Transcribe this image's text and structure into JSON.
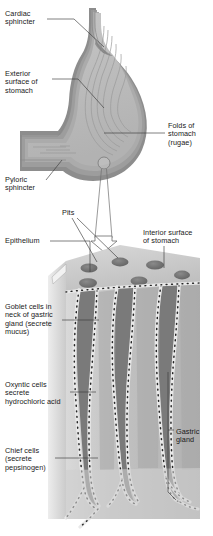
{
  "figure": {
    "background_color": "#ffffff",
    "text_color": "#1a1a1a",
    "leader_line_color": "#3a3a3a"
  },
  "palette": {
    "outer_muscle": "#8e8e8e",
    "muscle_mid": "#a6a6a6",
    "submucosa": "#b9b9b9",
    "mucosa_light": "#cfcfcf",
    "lumen": "#bdbdbd",
    "rugae_line": "#9a9a9a",
    "block_top": "#c8c8c8",
    "block_front": "#bcbcbc",
    "block_side": "#d6d6d6",
    "pit_dark": "#6f6f6f",
    "gland_lumen": "#7b7b7b",
    "cell_light": "#e8e8e8",
    "cell_dot": "#2b2b2b"
  },
  "upper_diagram": {
    "name": "stomach-sagittal-section",
    "labels": [
      {
        "id": "cardiac-sphincter",
        "text": "Cardiac\nsphincter",
        "x": 5,
        "y": 10,
        "leader": "from label right edge up-right to the esophageal junction"
      },
      {
        "id": "exterior-surface-of-stomach",
        "text": "Exterior\nsurface of\nstomach",
        "x": 5,
        "y": 70,
        "leader": "horizontal then diagonal down-right to the greater curvature wall"
      },
      {
        "id": "folds-of-stomach-rugae",
        "text": "Folds of\nstomach\n(rugae)",
        "x": 168,
        "y": 122,
        "leader": "horizontal left into the rugae of the stomach lumen"
      },
      {
        "id": "pyloric-sphincter",
        "text": "Pyloric\nsphincter",
        "x": 5,
        "y": 176,
        "leader": "diagonal up-right to the pyloric canal"
      }
    ],
    "callout": {
      "id": "magnification-callout",
      "circle_center_x": 104,
      "circle_center_y": 163,
      "circle_radius": 6,
      "arrow_tip_y": 246,
      "description": "small circle on the stomach wall expands downward into a hollow arrow pointing at the magnified block"
    }
  },
  "lower_diagram": {
    "name": "gastric-mucosa-block",
    "labels": [
      {
        "id": "pits",
        "text": "Pits",
        "x": 62,
        "y": 209,
        "leader": "two lines fanning down-right to two gastric pits on the block top"
      },
      {
        "id": "epithelium",
        "text": "Epithelium",
        "x": 5,
        "y": 238,
        "leader": "horizontal right to the cut epithelial edge of the block"
      },
      {
        "id": "interior-surface-of-stomach",
        "text": "Interior surface\nof stomach",
        "x": 143,
        "y": 229,
        "leader": "vertical down to the top face of the block"
      },
      {
        "id": "goblet-cells",
        "text": "Goblet cells in\nneck of gastric\ngland (secrete\nmucus)",
        "x": 5,
        "y": 303,
        "leader": "horizontal right to the neck of the left gastric gland"
      },
      {
        "id": "oxyntic-cells",
        "text": "Oxyntic cells\nsecrete\nhydrochloric acid",
        "x": 5,
        "y": 381,
        "leader": "horizontal right to the mid wall of the gland"
      },
      {
        "id": "chief-cells",
        "text": "Chief cells\n(secrete\npepsinogen)",
        "x": 5,
        "y": 447,
        "leader": "horizontal right to the deep base of the gland"
      },
      {
        "id": "gastric-gland",
        "text": "Gastric\ngland",
        "x": 176,
        "y": 428,
        "leader": "bracket on the left spanning the full depth of the right gland"
      }
    ],
    "pit_count_on_top_face": 6,
    "gland_count": 3
  }
}
